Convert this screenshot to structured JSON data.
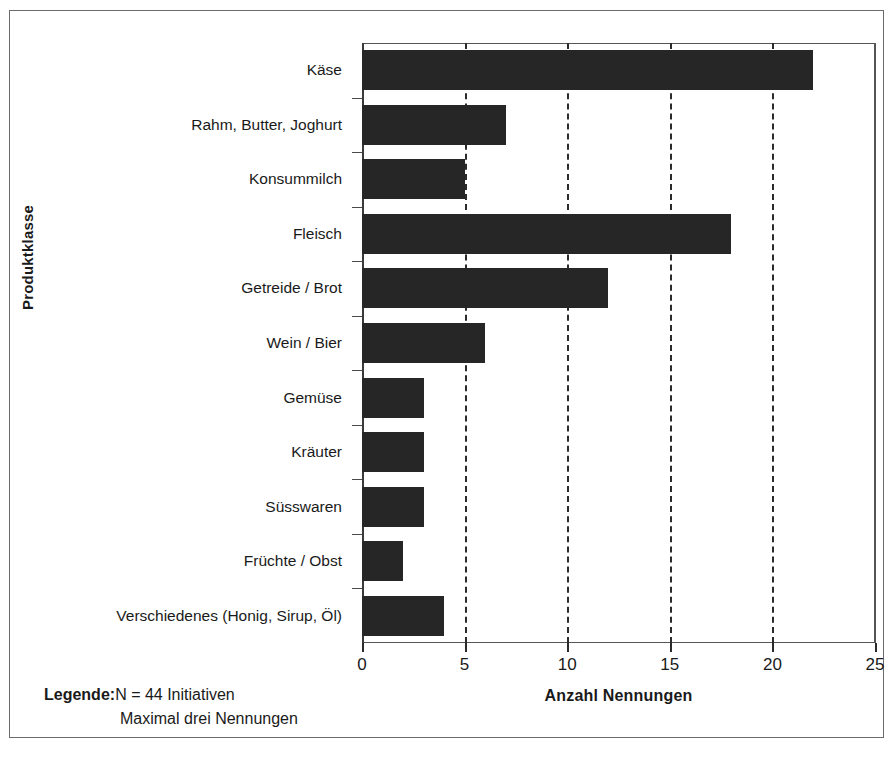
{
  "chart_data": {
    "type": "bar",
    "orientation": "horizontal",
    "title": "",
    "xlabel": "Anzahl Nennungen",
    "ylabel": "Produktklasse",
    "xlim": [
      0,
      25
    ],
    "xticks": [
      0,
      5,
      10,
      15,
      20,
      25
    ],
    "grid": "vertical-dashed",
    "legend_position": "below-left",
    "bar_color": "#262626",
    "categories": [
      "Käse",
      "Rahm, Butter, Joghurt",
      "Konsummilch",
      "Fleisch",
      "Getreide / Brot",
      "Wein / Bier",
      "Gemüse",
      "Kräuter",
      "Süsswaren",
      "Früchte / Obst",
      "Verschiedenes (Honig, Sirup, Öl)"
    ],
    "values": [
      22,
      7,
      5,
      18,
      12,
      6,
      3,
      3,
      3,
      2,
      4
    ],
    "annotations": [
      "N = 44 Initiativen",
      "Maximal drei Nennungen"
    ]
  },
  "legend": {
    "title": "Legende:",
    "line_1": "N = 44 Initiativen",
    "line_2": "Maximal drei Nennungen"
  }
}
